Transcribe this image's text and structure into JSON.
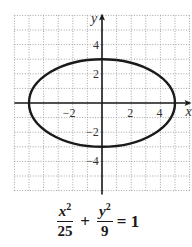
{
  "chart_data": {
    "type": "line",
    "title": "",
    "xlabel": "x",
    "ylabel": "y",
    "xlim": [
      -6,
      6
    ],
    "ylim": [
      -6,
      6
    ],
    "grid": true,
    "grid_style": "dotted",
    "x_ticks": [
      -2,
      2,
      4
    ],
    "x_tick_labels": [
      "−2",
      "2",
      "4"
    ],
    "y_ticks": [
      4,
      2,
      -2,
      -4
    ],
    "y_tick_labels": [
      "4",
      "2",
      "−2",
      "−4"
    ],
    "series": [
      {
        "name": "ellipse",
        "shape": "ellipse",
        "center": [
          0,
          0
        ],
        "semi_major_x": 5,
        "semi_minor_y": 3,
        "equation": "x^2/25 + y^2/9 = 1"
      }
    ],
    "annotations": [
      "x²/25 + y²/9 = 1"
    ]
  },
  "equation": {
    "term1": {
      "num": "x",
      "exp": "2",
      "den": "25"
    },
    "plus": "+",
    "term2": {
      "num": "y",
      "exp": "2",
      "den": "9"
    },
    "equals": "= 1"
  },
  "colors": {
    "curve": "#1a1a1a",
    "axis": "#1a1a1a",
    "grid": "#9a9a9a",
    "background": "#ffffff"
  }
}
